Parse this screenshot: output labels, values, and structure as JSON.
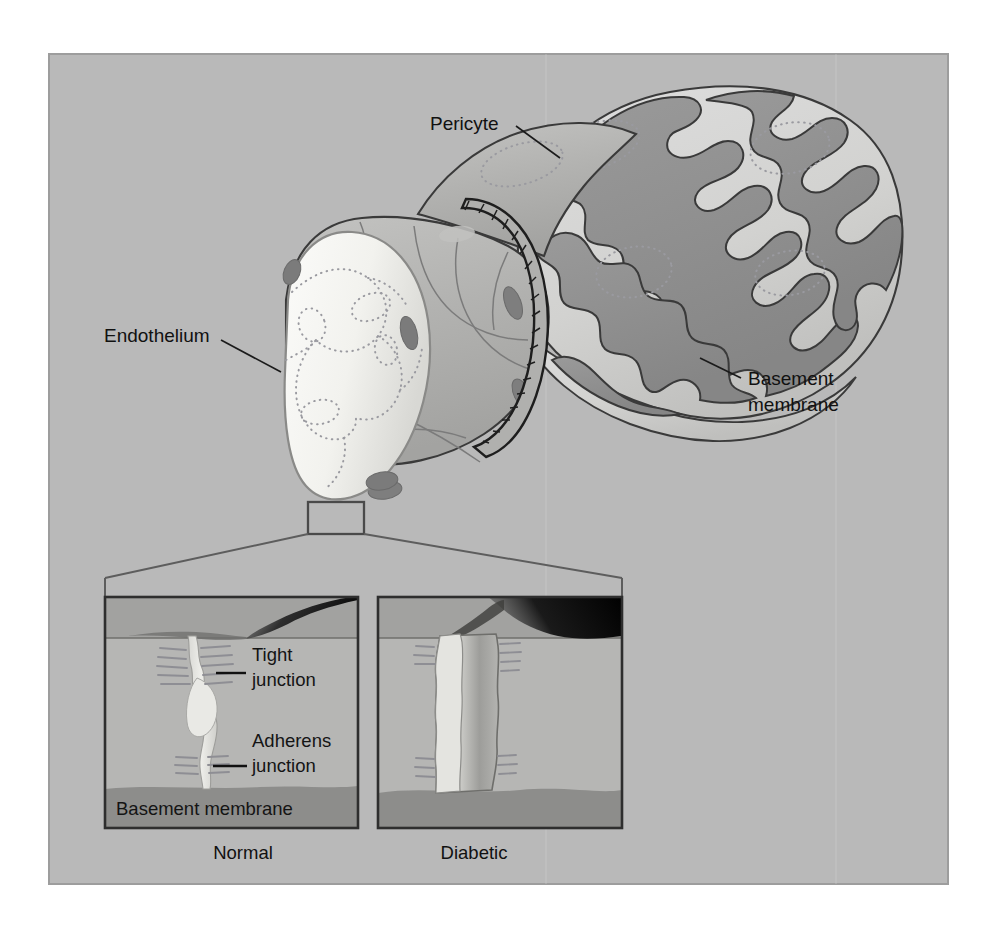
{
  "figure": {
    "background_color": "#ffffff",
    "panel_color": "#b9b9b9",
    "panel_border_color": "#9a9a9a"
  },
  "colors": {
    "panel_bg": "#b9b9b9",
    "vessel_body": "#b0b0b0",
    "vessel_body_light": "#c6c6c6",
    "lumen_light": "#f4f4f2",
    "basement_dark": "#8e8e8e",
    "basement_light": "#d6d6d4",
    "nucleus": "#7e7e7e",
    "outline": "#3a3a3a",
    "text": "#111111",
    "inset_bg": "#b4b4b4",
    "inset_band_top": "#9f9f9f",
    "inset_band_bottom": "#8c8c8c",
    "cleft_light": "#e6e6e2",
    "tracer_dark": "#111111"
  },
  "main_labels": [
    {
      "id": "pericyte",
      "text": "Pericyte",
      "x": 430,
      "y": 130,
      "anchor": "start"
    },
    {
      "id": "endothelium",
      "text": "Endothelium",
      "x": 104,
      "y": 342,
      "anchor": "start"
    },
    {
      "id": "basement-membrane",
      "line1": "Basement",
      "line2": "membrane",
      "x": 748,
      "y": 385,
      "anchor": "start"
    }
  ],
  "insets": {
    "left": {
      "id": "normal",
      "caption": "Normal",
      "caption_x": 243,
      "caption_y": 859,
      "x": 105,
      "y": 597,
      "width": 253,
      "height": 231,
      "labels": [
        {
          "id": "tight-junction",
          "line1": "Tight",
          "line2": "junction",
          "x": 252,
          "y": 661
        },
        {
          "id": "adherens-junction",
          "line1": "Adherens",
          "line2": "junction",
          "x": 252,
          "y": 747
        },
        {
          "id": "basement-membrane-inset",
          "text": "Basement membrane",
          "x": 116,
          "y": 815
        }
      ]
    },
    "right": {
      "id": "diabetic",
      "caption": "Diabetic",
      "caption_x": 474,
      "caption_y": 859,
      "x": 378,
      "y": 597,
      "width": 244,
      "height": 231,
      "labels": []
    }
  },
  "callout": {
    "id": "magnifier-box",
    "x": 308,
    "y": 502,
    "width": 56,
    "height": 32,
    "bracket_left_x": 105,
    "bracket_right_x": 622,
    "bracket_y": 578
  },
  "structures": [
    {
      "id": "vessel-lumen",
      "label": "endothelial lumen opening"
    },
    {
      "id": "endothelial-cell-borders",
      "label": "dotted endothelial cell outlines"
    },
    {
      "id": "endothelial-nuclei",
      "label": "dark oval nuclei"
    },
    {
      "id": "collar-band",
      "label": "ribbed cut edge of basement membrane"
    },
    {
      "id": "thickened-basement-membrane",
      "label": "amoeboid thickened basement membrane"
    },
    {
      "id": "pericyte-body",
      "label": "pericyte wrapping the capillary"
    },
    {
      "id": "tracer-leak",
      "label": "dark tracer leakage wedge"
    }
  ]
}
